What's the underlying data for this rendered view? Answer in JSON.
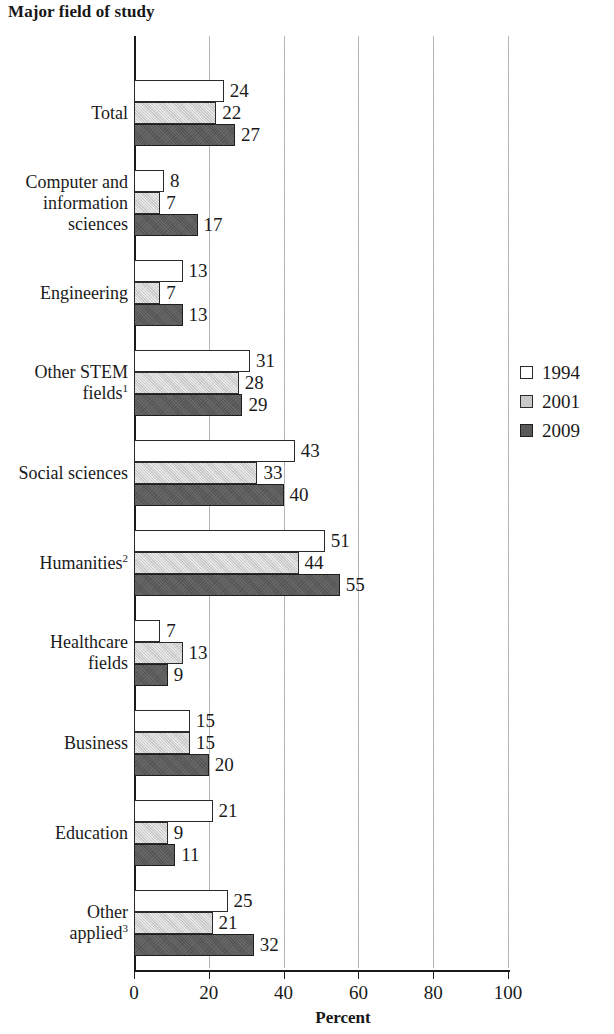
{
  "chart_data": {
    "type": "bar",
    "orientation": "horizontal",
    "title": "Major field of study",
    "xlabel": "Percent",
    "ylabel": "",
    "xlim": [
      0,
      100
    ],
    "xticks": [
      0,
      20,
      40,
      60,
      80,
      100
    ],
    "xtick_labels": [
      "0",
      "20",
      "40",
      "60",
      "80",
      "100"
    ],
    "grid": "vertical dashed gridlines at 20, 40, 60, 80, 100",
    "legend_position": "right-middle",
    "categories": [
      "Total",
      "Computer and information sciences",
      "Engineering",
      "Other STEM fields¹",
      "Social sciences",
      "Humanities²",
      "Healthcare fields",
      "Business",
      "Education",
      "Other applied³"
    ],
    "category_lines": [
      [
        "Total"
      ],
      [
        "Computer and",
        "information",
        "sciences"
      ],
      [
        "Engineering"
      ],
      [
        "Other STEM",
        "fields"
      ],
      [
        "Social sciences"
      ],
      [
        "Humanities"
      ],
      [
        "Healthcare",
        "fields"
      ],
      [
        "Business"
      ],
      [
        "Education"
      ],
      [
        "Other",
        "applied"
      ]
    ],
    "category_superscripts": [
      "",
      "",
      "",
      "1",
      "",
      "2",
      "",
      "",
      "",
      "3"
    ],
    "series": [
      {
        "name": "1994",
        "color": "#ffffff",
        "values": [
          24,
          8,
          13,
          31,
          43,
          51,
          7,
          15,
          21,
          25
        ]
      },
      {
        "name": "2001",
        "color": "#c9c9c9",
        "values": [
          22,
          7,
          7,
          28,
          33,
          44,
          13,
          15,
          9,
          21
        ]
      },
      {
        "name": "2009",
        "color": "#595959",
        "values": [
          27,
          17,
          13,
          29,
          40,
          55,
          9,
          20,
          11,
          32
        ]
      }
    ]
  },
  "legend": {
    "items": [
      {
        "label": "1994"
      },
      {
        "label": "2001"
      },
      {
        "label": "2009"
      }
    ]
  }
}
